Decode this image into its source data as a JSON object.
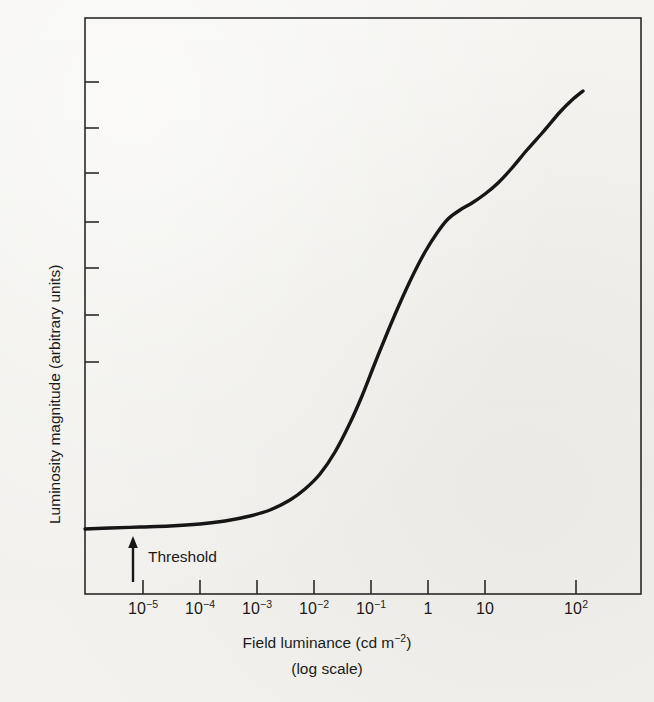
{
  "figure": {
    "background_color": "#f3f2ef",
    "ink_color": "#1b1b1b",
    "plot_frame": {
      "left": 85,
      "top": 18,
      "right": 641,
      "bottom": 594
    }
  },
  "axes": {
    "x_title_main": "Field luminance (cd m",
    "x_title_exponent": "−2",
    "x_title_tail": ")",
    "x_title_full": "Field luminance (cd m−2)",
    "x_subtitle": "(log scale)",
    "y_title": "Luminosity magnitude (arbitrary units)"
  },
  "annotations": {
    "threshold_label": "Threshold",
    "threshold_arrow_x": 133,
    "threshold_arrow_top": 537,
    "threshold_arrow_bottom": 582
  },
  "chart_data": {
    "type": "line",
    "title": "",
    "xlabel": "Field luminance (cd m−2) (log scale)",
    "ylabel": "Luminosity magnitude (arbitrary units)",
    "grid": false,
    "legend": "none",
    "x_scale": "log",
    "x_tick_labels": [
      {
        "mantissa": "10",
        "exponent": "−5",
        "value": 1e-05,
        "px": 143
      },
      {
        "mantissa": "10",
        "exponent": "−4",
        "value": 0.0001,
        "px": 200
      },
      {
        "mantissa": "10",
        "exponent": "−3",
        "value": 0.001,
        "px": 257
      },
      {
        "mantissa": "10",
        "exponent": "−2",
        "value": 0.01,
        "px": 314
      },
      {
        "mantissa": "10",
        "exponent": "−1",
        "value": 0.1,
        "px": 371
      },
      {
        "mantissa": "1",
        "exponent": "",
        "value": 1,
        "px": 428
      },
      {
        "mantissa": "10",
        "exponent": "",
        "value": 10,
        "px": 485
      },
      {
        "mantissa": "10",
        "exponent": "2",
        "value": 100,
        "px": 576
      }
    ],
    "y_tick_px": [
      82,
      128,
      173,
      222,
      268,
      315,
      362
    ],
    "y_tick_labels": [],
    "x_log_range": [
      -6.0,
      2.9
    ],
    "ylim_note": "arbitrary units, unlabeled",
    "series": [
      {
        "name": "luminosity magnitude",
        "description": "sigmoidal dark-adaptation / luminosity growth curve",
        "points_px": [
          [
            85,
            529
          ],
          [
            110,
            528
          ],
          [
            140,
            527
          ],
          [
            170,
            526
          ],
          [
            200,
            524
          ],
          [
            225,
            521
          ],
          [
            250,
            516
          ],
          [
            270,
            510
          ],
          [
            290,
            500
          ],
          [
            305,
            489
          ],
          [
            320,
            474
          ],
          [
            335,
            452
          ],
          [
            350,
            423
          ],
          [
            362,
            396
          ],
          [
            375,
            363
          ],
          [
            388,
            331
          ],
          [
            400,
            303
          ],
          [
            412,
            277
          ],
          [
            425,
            252
          ],
          [
            437,
            233
          ],
          [
            448,
            219
          ],
          [
            460,
            210
          ],
          [
            472,
            203
          ],
          [
            485,
            194
          ],
          [
            498,
            183
          ],
          [
            512,
            168
          ],
          [
            527,
            150
          ],
          [
            543,
            132
          ],
          [
            560,
            112
          ],
          [
            572,
            100
          ],
          [
            583,
            91
          ]
        ]
      }
    ]
  }
}
